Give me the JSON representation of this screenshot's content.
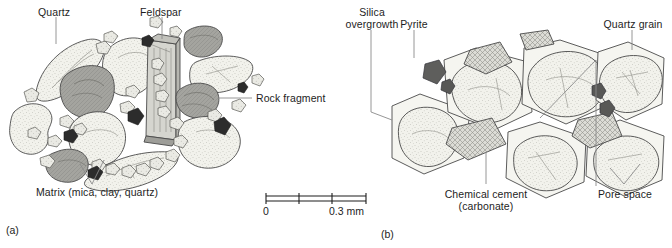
{
  "figure": {
    "background": "#ffffff",
    "ink": "#1d1d1d"
  },
  "panel_a": {
    "id": "(a)",
    "labels": {
      "quartz": "Quartz",
      "feldspar": "Feldspar",
      "rock_fragment": "Rock fragment",
      "matrix": "Matrix (mica, clay, quartz)"
    }
  },
  "panel_b": {
    "id": "(b)",
    "labels": {
      "silica_overgrowth_line1": "Silica",
      "silica_overgrowth_line2": "overgrowth",
      "pyrite": "Pyrite",
      "quartz_grain": "Quartz grain",
      "chemical_cement_line1": "Chemical cement",
      "chemical_cement_line2": "(carbonate)",
      "pore_space": "Pore space"
    }
  },
  "scale_bar": {
    "start_label": "0",
    "end_label": "0.3 mm",
    "ticks": 3
  },
  "colors": {
    "grain_light": "#efefe9",
    "grain_mid": "#d8d8d2",
    "rock_fragment": "#9d9d98",
    "rock_fragment_dark": "#7b7b77",
    "opaque": "#2e2e2e",
    "outline": "#4a4a4a",
    "leader": "#808080",
    "cement": "#d2d2cc"
  }
}
